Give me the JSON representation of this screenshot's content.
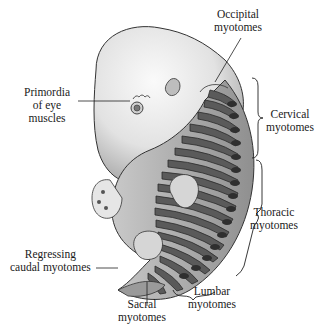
{
  "diagram": {
    "colors": {
      "body_light": "#e6e6e6",
      "body_mid": "#bdbdbd",
      "myotome_dark": "#3a3a3a",
      "myotome_mid": "#8a8a8a",
      "outline": "#222222"
    },
    "labels": {
      "occipital": {
        "line1": "Occipital",
        "line2": "myotomes"
      },
      "eye": {
        "line1": "Primordia",
        "line2": "of eye",
        "line3": "muscles"
      },
      "cervical": {
        "line1": "Cervical",
        "line2": "myotomes"
      },
      "thoracic": {
        "line1": "Thoracic",
        "line2": "myotomes"
      },
      "caudal": {
        "line1": "Regressing",
        "line2": "caudal myotomes"
      },
      "sacral": {
        "line1": "Sacral",
        "line2": "myotomes"
      },
      "lumbar": {
        "line1": "Lumbar",
        "line2": "myotomes"
      }
    }
  }
}
